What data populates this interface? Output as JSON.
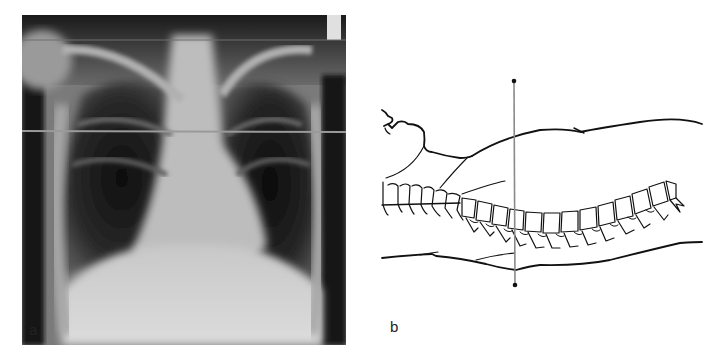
{
  "figure": {
    "panels": [
      {
        "id": "a",
        "label": "a",
        "kind": "chest-xray-image",
        "horizontal_reference_line": true
      },
      {
        "id": "b",
        "label": "b",
        "kind": "line-drawing-supine-patient-spine",
        "vertical_reference_line": true
      }
    ],
    "colors": {
      "background": "#ffffff",
      "xray_dark": "#141414",
      "xray_light": "#d8d8d8",
      "reference_line": "#8a8a8a",
      "drawing_stroke": "#111111"
    }
  }
}
